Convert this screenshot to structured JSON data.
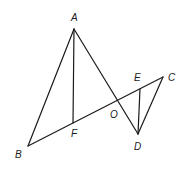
{
  "diagram": {
    "type": "geometry",
    "points": {
      "A": {
        "x": 74,
        "y": 29
      },
      "B": {
        "x": 28,
        "y": 146
      },
      "C": {
        "x": 163,
        "y": 77
      },
      "D": {
        "x": 138,
        "y": 134
      },
      "E": {
        "x": 140,
        "y": 89
      },
      "F": {
        "x": 73,
        "y": 123
      },
      "O": {
        "x": 117,
        "y": 100
      }
    },
    "segments": [
      [
        "A",
        "B"
      ],
      [
        "A",
        "D"
      ],
      [
        "A",
        "F"
      ],
      [
        "B",
        "C"
      ],
      [
        "C",
        "D"
      ],
      [
        "E",
        "D"
      ]
    ],
    "labels": {
      "A": "A",
      "B": "B",
      "C": "C",
      "D": "D",
      "E": "E",
      "F": "F",
      "O": "O"
    }
  }
}
